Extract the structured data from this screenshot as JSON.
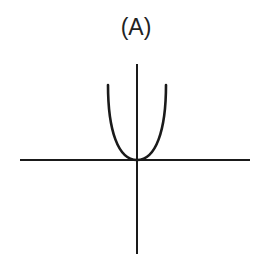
{
  "figure": {
    "label": "(A)",
    "colors": {
      "stroke": "#1a1a1a",
      "background": "#ffffff"
    }
  },
  "axes": {
    "x_axis": {
      "x1": 20,
      "x2": 250,
      "y": 160
    },
    "y_axis": {
      "x": 137,
      "y1": 64,
      "y2": 254
    }
  },
  "curve": {
    "type": "parabola",
    "vertex": [
      137,
      160
    ],
    "left_end": [
      108,
      85
    ],
    "right_end": [
      166,
      85
    ]
  }
}
